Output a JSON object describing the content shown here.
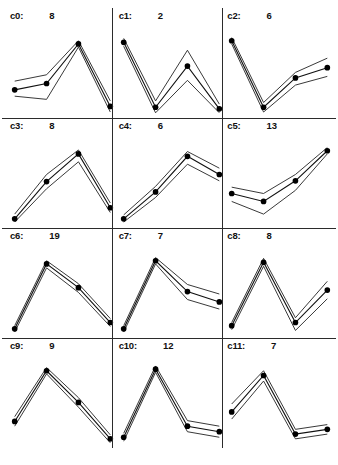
{
  "figure": {
    "columns": 3,
    "rows": 4,
    "series_colors": {
      "line": "#111111",
      "envelope": "#222222",
      "marker": "#000000",
      "separator": "#2b2b2b",
      "background": "#ffffff"
    },
    "caption": ""
  },
  "chart_data": {
    "type": "line",
    "xlabel": "",
    "ylabel": "",
    "x": [
      1,
      2,
      3,
      4
    ],
    "ylim": [
      0,
      100
    ],
    "grid": false,
    "legend": "none",
    "panel_label_format": "c{index}:  {count}",
    "series": [
      {
        "name": "c0",
        "label": "c0:",
        "count": 8,
        "values": [
          30,
          38,
          88,
          9
        ],
        "upper": [
          41,
          49,
          92,
          16
        ],
        "lower": [
          22,
          18,
          84,
          2
        ]
      },
      {
        "name": "c1",
        "label": "c1:",
        "count": 2,
        "values": [
          90,
          8,
          60,
          6
        ],
        "upper": [
          95,
          16,
          80,
          12
        ],
        "lower": [
          85,
          1,
          42,
          1
        ]
      },
      {
        "name": "c2",
        "label": "c2:",
        "count": 6,
        "values": [
          92,
          8,
          45,
          58
        ],
        "upper": [
          96,
          14,
          52,
          70
        ],
        "lower": [
          88,
          2,
          36,
          47
        ]
      },
      {
        "name": "c3",
        "label": "c3:",
        "count": 8,
        "values": [
          6,
          53,
          88,
          20
        ],
        "upper": [
          12,
          62,
          93,
          26
        ],
        "lower": [
          2,
          44,
          78,
          14
        ]
      },
      {
        "name": "c4",
        "label": "c4:",
        "count": 6,
        "values": [
          6,
          40,
          85,
          62
        ],
        "upper": [
          11,
          47,
          91,
          70
        ],
        "lower": [
          2,
          33,
          75,
          54
        ]
      },
      {
        "name": "c5",
        "label": "c5:",
        "count": 13,
        "values": [
          38,
          28,
          54,
          92
        ],
        "upper": [
          46,
          38,
          62,
          96
        ],
        "lower": [
          28,
          12,
          42,
          88
        ]
      },
      {
        "name": "c6",
        "label": "c6:",
        "count": 19,
        "values": [
          6,
          88,
          58,
          14
        ],
        "upper": [
          10,
          92,
          63,
          19
        ],
        "lower": [
          2,
          83,
          52,
          9
        ]
      },
      {
        "name": "c7",
        "label": "c7:",
        "count": 7,
        "values": [
          6,
          92,
          53,
          40
        ],
        "upper": [
          10,
          96,
          62,
          50
        ],
        "lower": [
          2,
          88,
          43,
          31
        ]
      },
      {
        "name": "c8",
        "label": "c8:",
        "count": 8,
        "values": [
          10,
          90,
          14,
          55
        ],
        "upper": [
          14,
          95,
          20,
          66
        ],
        "lower": [
          5,
          85,
          4,
          44
        ]
      },
      {
        "name": "c9",
        "label": "c9:",
        "count": 9,
        "values": [
          28,
          92,
          52,
          6
        ],
        "upper": [
          34,
          96,
          58,
          11
        ],
        "lower": [
          22,
          88,
          46,
          1
        ]
      },
      {
        "name": "c10",
        "label": "c10:",
        "count": 12,
        "values": [
          8,
          94,
          22,
          15
        ],
        "upper": [
          13,
          98,
          29,
          22
        ],
        "lower": [
          3,
          90,
          15,
          8
        ]
      },
      {
        "name": "c11",
        "label": "c11:",
        "count": 7,
        "values": [
          40,
          86,
          12,
          18
        ],
        "upper": [
          50,
          92,
          18,
          24
        ],
        "lower": [
          31,
          79,
          6,
          12
        ]
      }
    ]
  }
}
